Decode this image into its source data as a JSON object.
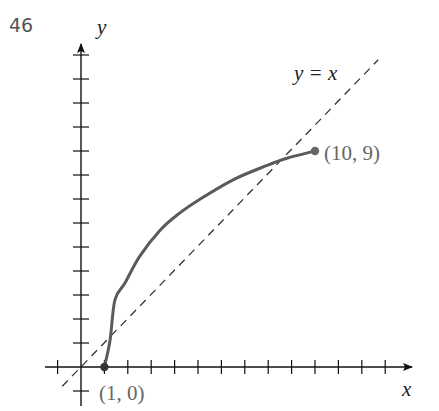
{
  "problem_number": "46",
  "chart_data": {
    "type": "line",
    "title": "",
    "xlabel": "x",
    "ylabel": "y",
    "xlim": [
      -1,
      14
    ],
    "ylim": [
      -1,
      13
    ],
    "grid": false,
    "x_tick_step": 1,
    "y_tick_step": 1,
    "series": [
      {
        "name": "curve",
        "style": "solid",
        "color": "#5a5a5a",
        "points": [
          [
            1,
            0
          ],
          [
            1.24,
            1.1
          ],
          [
            1.45,
            2.8
          ],
          [
            1.88,
            3.5
          ],
          [
            2.5,
            4.6
          ],
          [
            3.38,
            5.7
          ],
          [
            4.2,
            6.4
          ],
          [
            5.1,
            7.0
          ],
          [
            6.5,
            7.8
          ],
          [
            7.95,
            8.4
          ],
          [
            8.8,
            8.7
          ],
          [
            10,
            9
          ]
        ],
        "endpoints": [
          {
            "x": 1,
            "y": 0,
            "label": "(1, 0)"
          },
          {
            "x": 10,
            "y": 9,
            "label": "(10, 9)"
          }
        ]
      },
      {
        "name": "y = x",
        "style": "dashed",
        "color": "#333333",
        "points": [
          [
            -0.8,
            -0.8
          ],
          [
            12.7,
            12.8
          ]
        ]
      }
    ],
    "annotations": [
      {
        "text": "y = x",
        "x": 9.3,
        "y": 12.3
      },
      {
        "text": "(10, 9)",
        "x": 10.5,
        "y": 9
      },
      {
        "text": "(1, 0)",
        "x": 1,
        "y": -1
      }
    ]
  },
  "labels": {
    "x_axis": "x",
    "y_axis": "y",
    "line_label": "y = x",
    "start_point": "(1, 0)",
    "end_point": "(10, 9)"
  },
  "colors": {
    "axis": "#111111",
    "curve": "#5a5a5a",
    "dashed": "#333333",
    "point_label": "#666666"
  }
}
